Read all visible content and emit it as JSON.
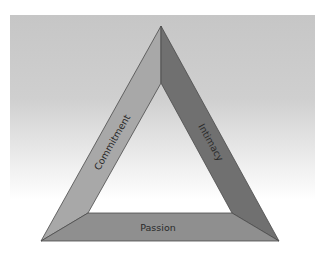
{
  "diagram": {
    "type": "triangle",
    "sides": [
      {
        "id": "commitment",
        "label": "Commitment",
        "position": "left",
        "color": "#a8a8a8"
      },
      {
        "id": "intimacy",
        "label": "Intimacy",
        "position": "right",
        "color": "#707070"
      },
      {
        "id": "passion",
        "label": "Passion",
        "position": "bottom",
        "color": "#8f8f8f"
      }
    ],
    "background_color": "#c8c8c8",
    "edge_color": "#4a4a4a"
  }
}
